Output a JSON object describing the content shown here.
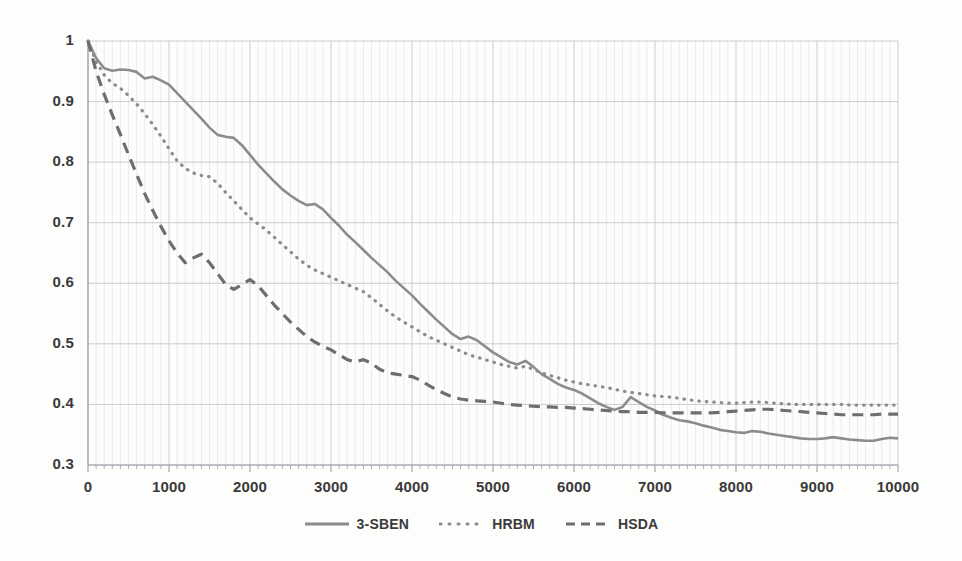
{
  "chart_data": {
    "type": "line",
    "title": "",
    "xlabel": "",
    "ylabel": "",
    "xlim": [
      0,
      10000
    ],
    "ylim": [
      0.3,
      1.0
    ],
    "xticks": [
      "0",
      "1000",
      "2000",
      "3000",
      "4000",
      "5000",
      "6000",
      "7000",
      "8000",
      "9000",
      "10000"
    ],
    "xtick_values": [
      0,
      1000,
      2000,
      3000,
      4000,
      5000,
      6000,
      7000,
      8000,
      9000,
      10000
    ],
    "yticks": [
      "0.3",
      "0.4",
      "0.5",
      "0.6",
      "0.7",
      "0.8",
      "0.9",
      "1"
    ],
    "ytick_values": [
      0.3,
      0.4,
      0.5,
      0.6,
      0.7,
      0.8,
      0.9,
      1.0
    ],
    "grid": true,
    "grid_minor_x": true,
    "legend_position": "bottom",
    "x": [
      0,
      100,
      200,
      300,
      400,
      500,
      600,
      700,
      800,
      900,
      1000,
      1100,
      1200,
      1300,
      1400,
      1500,
      1600,
      1700,
      1800,
      1900,
      2000,
      2100,
      2200,
      2300,
      2400,
      2500,
      2600,
      2700,
      2800,
      2900,
      3000,
      3100,
      3200,
      3300,
      3400,
      3500,
      3600,
      3700,
      3800,
      3900,
      4000,
      4100,
      4200,
      4300,
      4400,
      4500,
      4600,
      4700,
      4800,
      4900,
      5000,
      5100,
      5200,
      5300,
      5400,
      5500,
      5600,
      5700,
      5800,
      5900,
      6000,
      6100,
      6200,
      6300,
      6400,
      6500,
      6600,
      6700,
      6800,
      6900,
      7000,
      7100,
      7200,
      7300,
      7400,
      7500,
      7600,
      7700,
      7800,
      7900,
      8000,
      8100,
      8200,
      8300,
      8400,
      8500,
      8600,
      8700,
      8800,
      8900,
      9000,
      9100,
      9200,
      9300,
      9400,
      9500,
      9600,
      9700,
      9800,
      9900,
      10000
    ],
    "series": [
      {
        "name": "3-SBEN",
        "style": "solid",
        "color": "#8c8c8c",
        "values": [
          1.0,
          0.972,
          0.955,
          0.951,
          0.953,
          0.952,
          0.949,
          0.938,
          0.941,
          0.935,
          0.928,
          0.914,
          0.9,
          0.886,
          0.872,
          0.857,
          0.845,
          0.842,
          0.84,
          0.828,
          0.812,
          0.796,
          0.782,
          0.768,
          0.755,
          0.745,
          0.736,
          0.729,
          0.731,
          0.722,
          0.708,
          0.695,
          0.68,
          0.668,
          0.655,
          0.642,
          0.63,
          0.618,
          0.604,
          0.592,
          0.58,
          0.566,
          0.553,
          0.54,
          0.528,
          0.516,
          0.508,
          0.512,
          0.506,
          0.496,
          0.486,
          0.478,
          0.47,
          0.466,
          0.472,
          0.462,
          0.45,
          0.442,
          0.434,
          0.428,
          0.424,
          0.418,
          0.41,
          0.402,
          0.396,
          0.391,
          0.396,
          0.412,
          0.404,
          0.396,
          0.39,
          0.383,
          0.378,
          0.374,
          0.372,
          0.369,
          0.365,
          0.362,
          0.358,
          0.356,
          0.354,
          0.353,
          0.356,
          0.355,
          0.352,
          0.35,
          0.348,
          0.346,
          0.344,
          0.343,
          0.343,
          0.344,
          0.346,
          0.344,
          0.342,
          0.341,
          0.34,
          0.34,
          0.343,
          0.345,
          0.344
        ]
      },
      {
        "name": "HRBM",
        "style": "dotted",
        "color": "#8c8c8c",
        "values": [
          1.0,
          0.966,
          0.944,
          0.93,
          0.922,
          0.91,
          0.896,
          0.88,
          0.862,
          0.843,
          0.822,
          0.802,
          0.79,
          0.782,
          0.778,
          0.776,
          0.765,
          0.75,
          0.736,
          0.722,
          0.708,
          0.698,
          0.688,
          0.676,
          0.664,
          0.652,
          0.64,
          0.63,
          0.622,
          0.616,
          0.61,
          0.604,
          0.598,
          0.592,
          0.586,
          0.576,
          0.565,
          0.554,
          0.544,
          0.536,
          0.528,
          0.52,
          0.512,
          0.506,
          0.5,
          0.494,
          0.488,
          0.482,
          0.478,
          0.474,
          0.47,
          0.466,
          0.463,
          0.46,
          0.463,
          0.458,
          0.452,
          0.448,
          0.444,
          0.44,
          0.437,
          0.434,
          0.432,
          0.43,
          0.428,
          0.425,
          0.422,
          0.42,
          0.418,
          0.416,
          0.414,
          0.413,
          0.412,
          0.41,
          0.408,
          0.406,
          0.405,
          0.404,
          0.403,
          0.402,
          0.402,
          0.403,
          0.404,
          0.404,
          0.403,
          0.402,
          0.401,
          0.4,
          0.4,
          0.4,
          0.4,
          0.4,
          0.4,
          0.4,
          0.399,
          0.399,
          0.399,
          0.399,
          0.399,
          0.399,
          0.399
        ]
      },
      {
        "name": "HSDA",
        "style": "dashed",
        "color": "#6e6e6e",
        "values": [
          1.0,
          0.95,
          0.912,
          0.878,
          0.846,
          0.812,
          0.78,
          0.748,
          0.72,
          0.694,
          0.67,
          0.65,
          0.634,
          0.642,
          0.648,
          0.634,
          0.616,
          0.598,
          0.59,
          0.598,
          0.606,
          0.596,
          0.58,
          0.564,
          0.55,
          0.536,
          0.524,
          0.512,
          0.503,
          0.496,
          0.49,
          0.482,
          0.474,
          0.47,
          0.474,
          0.468,
          0.458,
          0.452,
          0.45,
          0.448,
          0.446,
          0.44,
          0.432,
          0.424,
          0.418,
          0.412,
          0.409,
          0.407,
          0.406,
          0.405,
          0.404,
          0.402,
          0.4,
          0.399,
          0.398,
          0.397,
          0.396,
          0.396,
          0.395,
          0.395,
          0.394,
          0.393,
          0.392,
          0.391,
          0.39,
          0.389,
          0.388,
          0.388,
          0.387,
          0.387,
          0.387,
          0.386,
          0.386,
          0.386,
          0.386,
          0.386,
          0.386,
          0.386,
          0.387,
          0.388,
          0.389,
          0.39,
          0.391,
          0.392,
          0.392,
          0.391,
          0.39,
          0.389,
          0.388,
          0.387,
          0.386,
          0.385,
          0.384,
          0.383,
          0.383,
          0.383,
          0.383,
          0.383,
          0.384,
          0.384,
          0.384
        ]
      }
    ]
  },
  "legend": {
    "items": [
      {
        "label": "3-SBEN",
        "style": "solid"
      },
      {
        "label": "HRBM",
        "style": "dotted"
      },
      {
        "label": "HSDA",
        "style": "dashed"
      }
    ]
  },
  "colors": {
    "line_solid": "#8c8c8c",
    "line_dotted": "#8c8c8c",
    "line_dashed": "#6e6e6e",
    "grid_major": "#c9cdd2",
    "grid_minor": "#dfe3e6",
    "axis": "#9aa0a6",
    "text": "#3a3a3a",
    "background": "#fdfdfc"
  }
}
